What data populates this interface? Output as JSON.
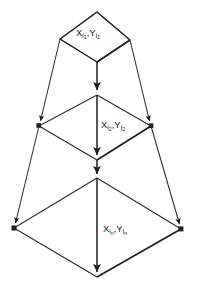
{
  "diagram": {
    "type": "stacked-diamond-pyramid",
    "title": "",
    "background_color": "#ffffff",
    "stroke_color": "#2b2b2b",
    "label_color": "#1a1a1a",
    "levels": [
      {
        "id": "level-1",
        "label_x_base": "X",
        "label_x_sub": "i",
        "label_x_subsub": "1",
        "separator": ",",
        "label_y_base": "Y",
        "label_y_sub": "i",
        "label_y_subsub": "1",
        "label_plain": "Xi1,Yi1",
        "top": [
          97,
          12
        ],
        "left": [
          60,
          39
        ],
        "right": [
          130,
          40
        ],
        "bottom": [
          97,
          62
        ],
        "label_pos": [
          76,
          33
        ]
      },
      {
        "id": "level-2",
        "label_x_base": "X",
        "label_x_sub": "i",
        "label_x_subsub": "2",
        "separator": ",",
        "label_y_base": "Y",
        "label_y_sub": "i",
        "label_y_subsub": "2",
        "label_plain": "Xi2,Yi2",
        "top": [
          97,
          95
        ],
        "left": [
          39,
          126
        ],
        "right": [
          151,
          126
        ],
        "bottom": [
          97,
          160
        ],
        "label_pos": [
          101,
          125
        ]
      },
      {
        "id": "level-3",
        "label_x_base": "X",
        "label_x_sub": "i",
        "label_x_subsub": "n",
        "separator": ",",
        "label_y_base": "Y",
        "label_y_sub": "i",
        "label_y_subsub": "n",
        "label_plain": "Xin,Yin",
        "top": [
          97,
          178
        ],
        "left": [
          14,
          228
        ],
        "right": [
          181,
          229
        ],
        "bottom": [
          97,
          277
        ],
        "label_pos": [
          103,
          229
        ]
      }
    ],
    "axis_arrows": [
      {
        "id": "axis-1",
        "from": [
          97,
          62
        ],
        "to": [
          97,
          95
        ]
      },
      {
        "id": "axis-2",
        "from": [
          97,
          95
        ],
        "to": [
          97,
          160
        ]
      },
      {
        "id": "axis-3",
        "from": [
          97,
          160
        ],
        "to": [
          97,
          178
        ]
      },
      {
        "id": "axis-4",
        "from": [
          97,
          178
        ],
        "to": [
          97,
          277
        ]
      }
    ],
    "side_edges": [
      {
        "id": "left-edge-1",
        "from": [
          60,
          39
        ],
        "to": [
          39,
          126
        ]
      },
      {
        "id": "left-edge-2",
        "from": [
          39,
          126
        ],
        "to": [
          14,
          228
        ]
      },
      {
        "id": "right-edge-1",
        "from": [
          130,
          40
        ],
        "to": [
          151,
          126
        ]
      },
      {
        "id": "right-edge-2",
        "from": [
          151,
          126
        ],
        "to": [
          181,
          229
        ]
      }
    ]
  }
}
